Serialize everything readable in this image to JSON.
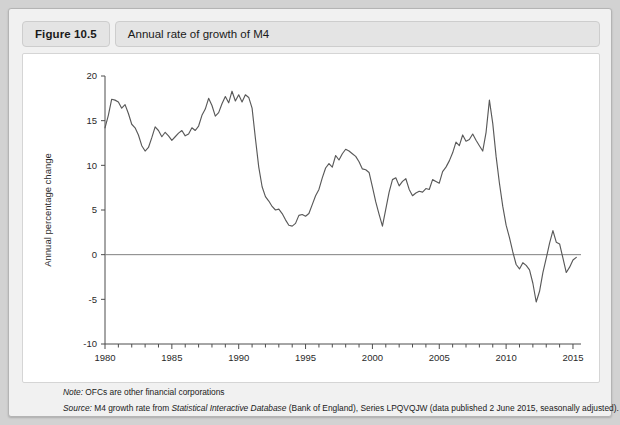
{
  "figure": {
    "number": "Figure 10.5",
    "title": "Annual rate of growth of M4"
  },
  "notes": {
    "note_label": "Note:",
    "note_text": " OFCs are other financial corporations",
    "source_label": "Source:",
    "source_pre": " M4 growth rate from ",
    "source_italic": "Statistical Interactive Database",
    "source_post": " (Bank of England), Series LPQVQJW (data published 2 June 2015, seasonally adjusted)."
  },
  "colors": {
    "line": "#595959",
    "zero_line": "#808080",
    "axis": "#4d4d4d",
    "panel_bg": "#ffffff",
    "card_bg": "#f1f1f1",
    "pill_bg": "#e4e4e4",
    "page_bg": "#d2d2d2"
  },
  "chart_data": {
    "type": "line",
    "title": "Annual rate of growth of M4",
    "xlabel": "",
    "ylabel": "Annual percentage change",
    "xlim": [
      1980,
      2015.6
    ],
    "ylim": [
      -10,
      20
    ],
    "yticks": [
      20,
      15,
      10,
      5,
      0,
      -5,
      -10
    ],
    "xticks": [
      1980,
      1985,
      1990,
      1995,
      2000,
      2005,
      2010,
      2015
    ],
    "xtick_labels": [
      "1980",
      "1985",
      "1990",
      "1995",
      "2000",
      "2005",
      "2010",
      "2015"
    ],
    "ytick_labels": [
      "20",
      "15",
      "10",
      "5",
      "0",
      "-5",
      "-10"
    ],
    "minor_xtick_interval": 1,
    "grid": false,
    "legend": null,
    "zero_reference_line": 0,
    "series": [
      {
        "name": "M4 annual growth",
        "x": [
          1980.0,
          1980.25,
          1980.5,
          1980.75,
          1981.0,
          1981.25,
          1981.5,
          1981.75,
          1982.0,
          1982.25,
          1982.5,
          1982.75,
          1983.0,
          1983.25,
          1983.5,
          1983.75,
          1984.0,
          1984.25,
          1984.5,
          1984.75,
          1985.0,
          1985.25,
          1985.5,
          1985.75,
          1986.0,
          1986.25,
          1986.5,
          1986.75,
          1987.0,
          1987.25,
          1987.5,
          1987.75,
          1988.0,
          1988.25,
          1988.5,
          1988.75,
          1989.0,
          1989.25,
          1989.5,
          1989.75,
          1990.0,
          1990.25,
          1990.5,
          1990.75,
          1991.0,
          1991.25,
          1991.5,
          1991.75,
          1992.0,
          1992.25,
          1992.5,
          1992.75,
          1993.0,
          1993.25,
          1993.5,
          1993.75,
          1994.0,
          1994.25,
          1994.5,
          1994.75,
          1995.0,
          1995.25,
          1995.5,
          1995.75,
          1996.0,
          1996.25,
          1996.5,
          1996.75,
          1997.0,
          1997.25,
          1997.5,
          1997.75,
          1998.0,
          1998.25,
          1998.5,
          1998.75,
          1999.0,
          1999.25,
          1999.5,
          1999.75,
          2000.0,
          2000.25,
          2000.5,
          2000.75,
          2001.0,
          2001.25,
          2001.5,
          2001.75,
          2002.0,
          2002.25,
          2002.5,
          2002.75,
          2003.0,
          2003.25,
          2003.5,
          2003.75,
          2004.0,
          2004.25,
          2004.5,
          2004.75,
          2005.0,
          2005.25,
          2005.5,
          2005.75,
          2006.0,
          2006.25,
          2006.5,
          2006.75,
          2007.0,
          2007.25,
          2007.5,
          2007.75,
          2008.0,
          2008.25,
          2008.5,
          2008.75,
          2009.0,
          2009.25,
          2009.5,
          2009.75,
          2010.0,
          2010.25,
          2010.5,
          2010.75,
          2011.0,
          2011.25,
          2011.5,
          2011.75,
          2012.0,
          2012.25,
          2012.5,
          2012.75,
          2013.0,
          2013.25,
          2013.5,
          2013.75,
          2014.0,
          2014.25,
          2014.5,
          2014.75,
          2015.0,
          2015.25
        ],
        "y": [
          14.2,
          15.6,
          17.4,
          17.3,
          17.1,
          16.4,
          16.8,
          15.8,
          14.6,
          14.2,
          13.4,
          12.2,
          11.6,
          12.0,
          13.1,
          14.3,
          13.9,
          13.2,
          13.7,
          13.3,
          12.8,
          13.2,
          13.6,
          13.9,
          13.3,
          13.5,
          14.2,
          13.9,
          14.4,
          15.6,
          16.3,
          17.5,
          16.7,
          15.5,
          15.9,
          16.9,
          17.7,
          17.0,
          18.3,
          17.2,
          17.9,
          17.1,
          17.9,
          17.6,
          16.4,
          13.0,
          9.8,
          7.6,
          6.5,
          6.0,
          5.4,
          5.0,
          5.1,
          4.6,
          3.9,
          3.3,
          3.2,
          3.5,
          4.4,
          4.5,
          4.3,
          4.6,
          5.6,
          6.6,
          7.3,
          8.6,
          9.7,
          10.2,
          9.8,
          11.1,
          10.6,
          11.3,
          11.8,
          11.6,
          11.3,
          11.0,
          10.4,
          9.6,
          9.5,
          9.2,
          7.6,
          5.9,
          4.5,
          3.2,
          5.1,
          7.0,
          8.4,
          8.6,
          7.7,
          8.2,
          8.5,
          7.3,
          6.6,
          6.9,
          7.1,
          7.0,
          7.4,
          7.3,
          8.4,
          8.2,
          8.0,
          9.3,
          9.8,
          10.5,
          11.4,
          12.6,
          12.2,
          13.4,
          12.7,
          12.9,
          13.5,
          12.8,
          12.2,
          11.6,
          13.7,
          17.3,
          14.7,
          11.0,
          8.0,
          5.4,
          3.3,
          1.9,
          0.3,
          -1.1,
          -1.6,
          -0.9,
          -1.2,
          -1.7,
          -3.2,
          -5.3,
          -4.1,
          -2.0,
          -0.4,
          1.3,
          2.7,
          1.4,
          1.2,
          -0.4,
          -2.0,
          -1.4,
          -0.6,
          -0.3
        ]
      }
    ],
    "annotations": [
      {
        "label": "1980s peak",
        "x": 1989.5,
        "y": 18.3
      },
      {
        "label": "early-1990s trough",
        "x": 1993.75,
        "y": 3.3
      },
      {
        "label": "1999/2000 dip",
        "x": 2000.75,
        "y": 3.2
      },
      {
        "label": "2008 crisis peak",
        "x": 2008.75,
        "y": 17.3
      },
      {
        "label": "2012 trough",
        "x": 2012.25,
        "y": -5.3
      }
    ]
  }
}
